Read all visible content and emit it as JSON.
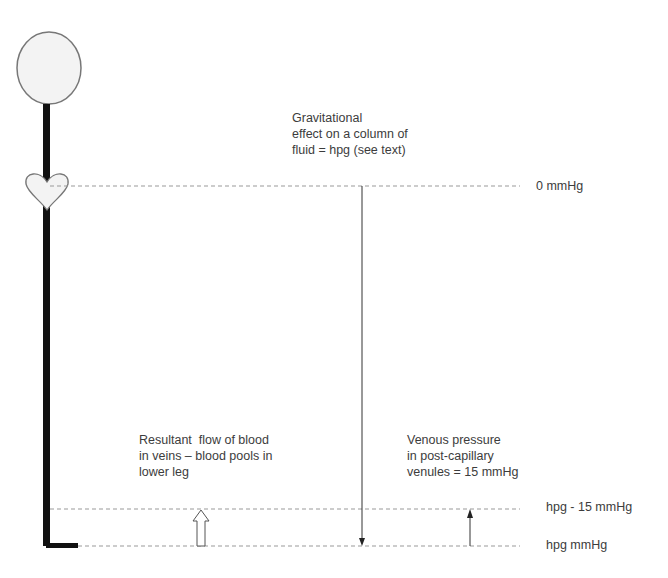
{
  "diagram": {
    "labels": {
      "gravity_line1": "Gravitational",
      "gravity_line2": "effect on a column of",
      "gravity_line3": "fluid = hpg (see text)",
      "zero_level": "0 mmHg",
      "flow_line1": "Resultant  flow of blood",
      "flow_line2": "in veins – blood pools in",
      "flow_line3": "lower leg",
      "venous_line1": "Venous pressure",
      "venous_line2": "in post-capillary",
      "venous_line3": "venules = 15 mmHg",
      "level_minus15": "hpg - 15 mmHg",
      "level_bottom": "hpg mmHg"
    },
    "colors": {
      "body": "#111111",
      "outline": "#777777",
      "fill": "#f3f3f3",
      "dashed": "#999999",
      "arrow": "#333333"
    }
  }
}
